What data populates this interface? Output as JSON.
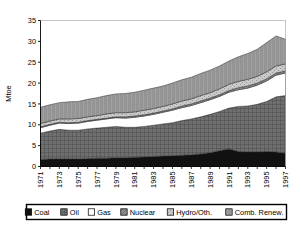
{
  "chart_data": {
    "type": "area",
    "stacked": true,
    "title": "",
    "xlabel": "",
    "ylabel": "Mtoe",
    "ylim": [
      0,
      35
    ],
    "yticks": [
      0,
      5,
      10,
      15,
      20,
      25,
      30,
      35
    ],
    "grid": false,
    "legend_position": "bottom",
    "x": [
      1971,
      1972,
      1973,
      1974,
      1975,
      1976,
      1977,
      1978,
      1979,
      1980,
      1981,
      1982,
      1983,
      1984,
      1985,
      1986,
      1987,
      1988,
      1989,
      1990,
      1991,
      1992,
      1993,
      1994,
      1995,
      1996,
      1997
    ],
    "xticklabels": [
      "1971",
      "1973",
      "1975",
      "1977",
      "1979",
      "1981",
      "1983",
      "1985",
      "1987",
      "1989",
      "1991",
      "1993",
      "1995",
      "1997"
    ],
    "series": [
      {
        "name": "Coal",
        "color": "#111111",
        "pattern": "solid",
        "values": [
          1.7,
          1.8,
          1.8,
          1.8,
          1.8,
          1.9,
          2.0,
          2.0,
          2.1,
          2.1,
          2.2,
          2.3,
          2.4,
          2.5,
          2.6,
          2.7,
          2.8,
          3.0,
          3.3,
          3.8,
          4.2,
          3.6,
          3.5,
          3.5,
          3.6,
          3.5,
          3.2
        ]
      },
      {
        "name": "Oil",
        "color": "#6f6f6f",
        "pattern": "grid",
        "values": [
          6.3,
          6.7,
          7.1,
          6.9,
          6.9,
          7.1,
          7.2,
          7.4,
          7.5,
          7.3,
          7.2,
          7.3,
          7.5,
          7.7,
          7.9,
          8.3,
          8.6,
          8.9,
          9.2,
          9.4,
          9.8,
          10.8,
          11.0,
          11.4,
          12.0,
          13.2,
          13.8
        ]
      },
      {
        "name": "Gas",
        "color": "#ffffff",
        "pattern": "solid",
        "values": [
          1.3,
          1.4,
          1.5,
          1.6,
          1.7,
          1.8,
          1.9,
          2.0,
          2.1,
          2.2,
          2.4,
          2.5,
          2.6,
          2.8,
          3.0,
          3.1,
          3.2,
          3.4,
          3.5,
          3.6,
          3.8,
          4.0,
          4.3,
          4.6,
          4.9,
          5.2,
          5.4
        ]
      },
      {
        "name": "Nuclear",
        "color": "#8c8c8c",
        "pattern": "diag",
        "values": [
          0.2,
          0.2,
          0.2,
          0.2,
          0.2,
          0.2,
          0.2,
          0.2,
          0.2,
          0.3,
          0.3,
          0.3,
          0.3,
          0.3,
          0.3,
          0.4,
          0.4,
          0.4,
          0.4,
          0.4,
          0.4,
          0.5,
          0.5,
          0.5,
          0.5,
          0.5,
          0.5
        ]
      },
      {
        "name": "Hydro/Oth.",
        "color": "#c9c9c9",
        "pattern": "dots",
        "values": [
          0.8,
          0.8,
          0.8,
          0.9,
          0.9,
          0.9,
          0.9,
          1.0,
          1.0,
          1.0,
          1.0,
          1.1,
          1.1,
          1.1,
          1.2,
          1.2,
          1.2,
          1.3,
          1.3,
          1.4,
          1.5,
          1.5,
          1.6,
          1.6,
          1.7,
          1.7,
          1.7
        ]
      },
      {
        "name": "Comb. Renew.",
        "color": "#a0a0a0",
        "pattern": "vert",
        "values": [
          3.9,
          3.9,
          3.9,
          4.1,
          4.1,
          4.2,
          4.3,
          4.4,
          4.5,
          4.6,
          4.7,
          4.8,
          4.9,
          4.9,
          5.0,
          5.1,
          5.2,
          5.3,
          5.4,
          5.5,
          5.6,
          5.9,
          6.2,
          6.5,
          7.0,
          7.2,
          5.9
        ]
      }
    ],
    "totals": [
      14.2,
      14.8,
      15.3,
      15.5,
      15.6,
      16.1,
      16.5,
      17.0,
      17.4,
      17.5,
      17.8,
      18.3,
      18.8,
      19.3,
      20.0,
      20.8,
      21.4,
      22.3,
      23.1,
      24.1,
      25.3,
      26.3,
      27.1,
      28.1,
      29.7,
      31.3,
      30.5
    ]
  },
  "legend": {
    "items": [
      {
        "label": "Coal"
      },
      {
        "label": "Oil"
      },
      {
        "label": "Gas"
      },
      {
        "label": "Nuclear"
      },
      {
        "label": "Hydro/Oth."
      },
      {
        "label": "Comb. Renew."
      }
    ]
  }
}
